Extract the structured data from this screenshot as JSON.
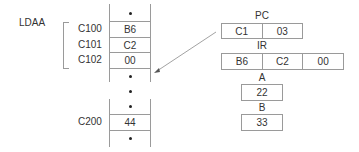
{
  "instruction": {
    "mnemonic": "LDAA"
  },
  "memory": {
    "block1": [
      {
        "address": "",
        "value": "•"
      },
      {
        "address": "C100",
        "value": "B6"
      },
      {
        "address": "C101",
        "value": "C2"
      },
      {
        "address": "C102",
        "value": "00"
      },
      {
        "address": "",
        "value": "•"
      }
    ],
    "gap_dot": "•",
    "block2": [
      {
        "address": "",
        "value": "•"
      },
      {
        "address": "C200",
        "value": "44"
      },
      {
        "address": "",
        "value": "•"
      }
    ]
  },
  "registers": {
    "pc": {
      "label": "PC",
      "cells": [
        "C1",
        "03"
      ]
    },
    "ir": {
      "label": "IR",
      "cells": [
        "B6",
        "C2",
        "00"
      ]
    },
    "a": {
      "label": "A",
      "value": "22"
    },
    "b": {
      "label": "B",
      "value": "33"
    }
  }
}
